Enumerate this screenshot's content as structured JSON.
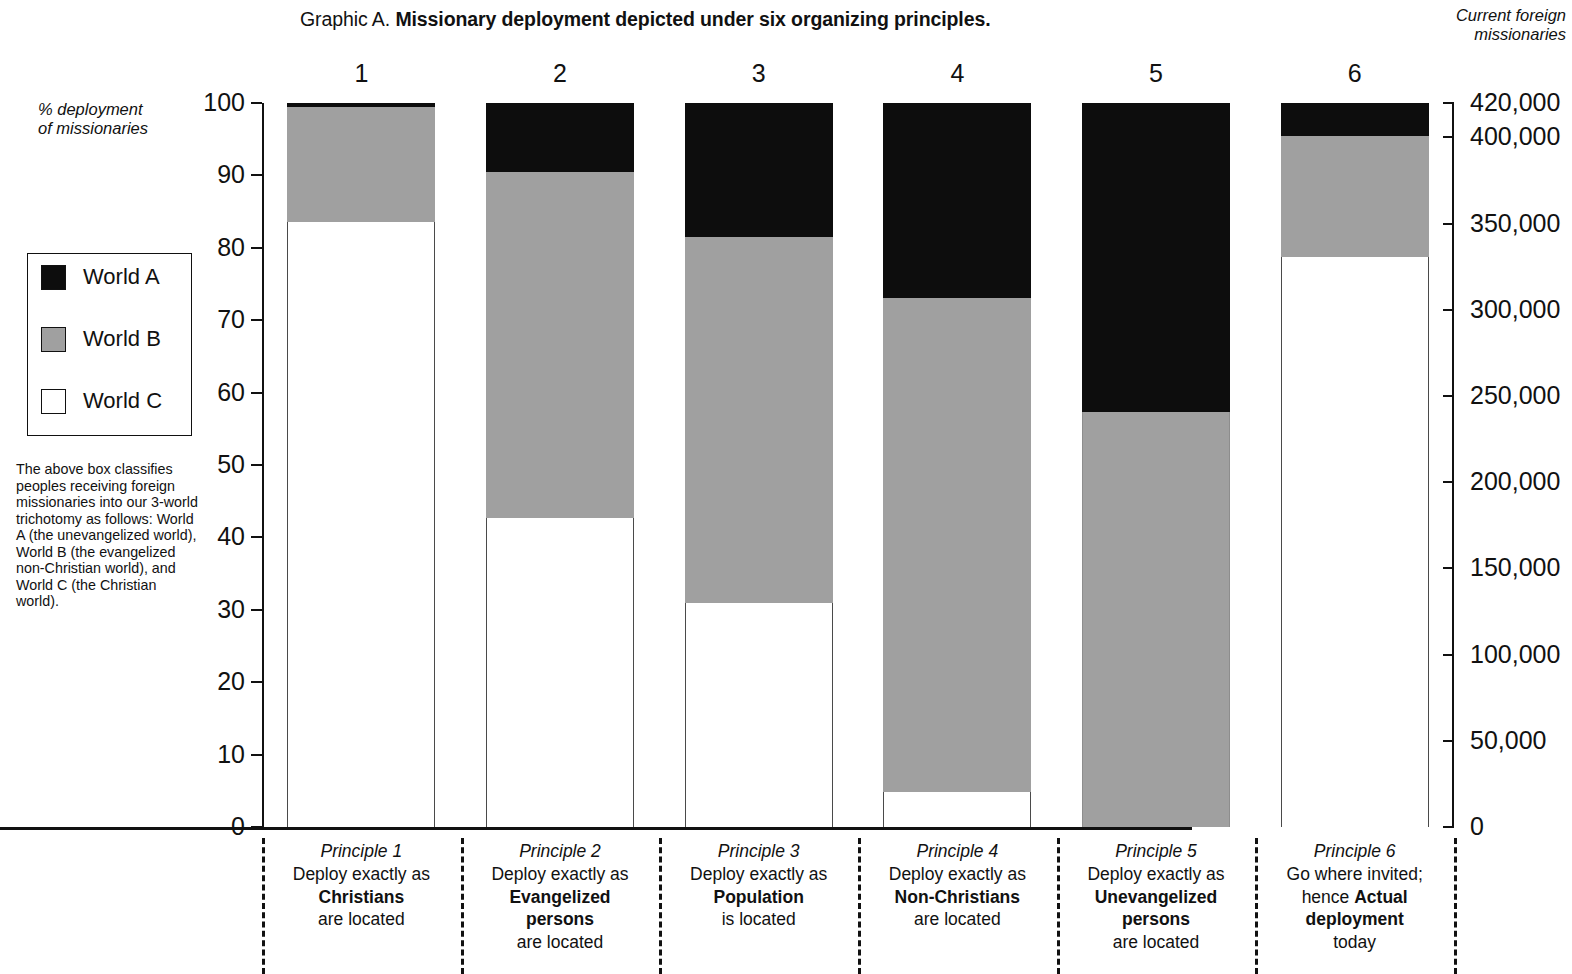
{
  "title": {
    "prefix": "Graphic A.",
    "bold": "Missionary deployment depicted under six organizing principles."
  },
  "right_header": "Current foreign\nmissionaries",
  "left_axis_caption": "% deployment\nof missionaries",
  "legend": {
    "items": [
      {
        "label": "World A",
        "color": "#0d0d0d",
        "swatch": "world-a-swatch"
      },
      {
        "label": "World B",
        "color": "#a0a0a0",
        "swatch": "world-b-swatch"
      },
      {
        "label": "World C",
        "color": "#ffffff",
        "swatch": "world-c-swatch"
      }
    ],
    "note": "The above box classifies peoples receiving foreign missionaries into our 3-world trichotomy as follows: World A (the unevangelized world), World B (the evangelized non-Christian world), and World C (the Christian world)."
  },
  "column_numbers": [
    "1",
    "2",
    "3",
    "4",
    "5",
    "6"
  ],
  "principles": [
    {
      "name": "Principle 1",
      "line1": "Deploy exactly as",
      "strong": "Christians",
      "line3": "are located"
    },
    {
      "name": "Principle 2",
      "line1": "Deploy exactly as",
      "strong": "Evangelized\npersons",
      "line3": "are located"
    },
    {
      "name": "Principle 3",
      "line1": "Deploy exactly as",
      "strong": "Population",
      "line3": "is located"
    },
    {
      "name": "Principle 4",
      "line1": "Deploy exactly as",
      "strong": "Non-Christians",
      "line3": "are located"
    },
    {
      "name": "Principle 5",
      "line1": "Deploy exactly as",
      "strong": "Unevangelized\npersons",
      "line3": "are located"
    },
    {
      "name": "Principle 6",
      "line1": "Go where invited;",
      "pre2": "hence ",
      "strong": "Actual\ndeployment",
      "line3": "today"
    }
  ],
  "chart_data": {
    "type": "bar",
    "subtype": "stacked-100-percent",
    "title": "Graphic A. Missionary deployment depicted under six organizing principles.",
    "categories": [
      "1",
      "2",
      "3",
      "4",
      "5",
      "6"
    ],
    "category_descriptions": [
      "Principle 1 — Deploy exactly as Christians are located",
      "Principle 2 — Deploy exactly as Evangelized persons are located",
      "Principle 3 — Deploy exactly as Population is located",
      "Principle 4 — Deploy exactly as Non-Christians are located",
      "Principle 5 — Deploy exactly as Unevangelized persons are located",
      "Principle 6 — Go where invited; hence Actual deployment today"
    ],
    "series": [
      {
        "name": "World A",
        "color": "#0d0d0d",
        "values": [
          0.5,
          9.5,
          18.5,
          27.0,
          42.7,
          4.6
        ]
      },
      {
        "name": "World B",
        "color": "#a0a0a0",
        "values": [
          16.0,
          47.8,
          50.5,
          68.2,
          57.3,
          16.6
        ]
      },
      {
        "name": "World C",
        "color": "#ffffff",
        "values": [
          83.5,
          42.7,
          31.0,
          4.8,
          0.0,
          78.8
        ]
      }
    ],
    "stack_order_bottom_to_top": [
      "World C",
      "World B",
      "World A"
    ],
    "ylabel": "% deployment of missionaries",
    "ylim": [
      0,
      100
    ],
    "yticks": [
      0,
      10,
      20,
      30,
      40,
      50,
      60,
      70,
      80,
      90,
      100
    ],
    "ytick_labels": [
      "0",
      "10",
      "20",
      "30",
      "40",
      "50",
      "60",
      "70",
      "80",
      "90",
      "100"
    ],
    "y2label": "Current foreign missionaries",
    "y2lim": [
      0,
      420000
    ],
    "y2ticks": [
      0,
      50000,
      100000,
      150000,
      200000,
      250000,
      300000,
      350000,
      400000,
      420000
    ],
    "y2tick_labels": [
      "0",
      "50,000",
      "100,000",
      "150,000",
      "200,000",
      "250,000",
      "300,000",
      "350,000",
      "400,000",
      "420,000"
    ],
    "xlabel": "",
    "grid": false,
    "legend_position": "left"
  }
}
